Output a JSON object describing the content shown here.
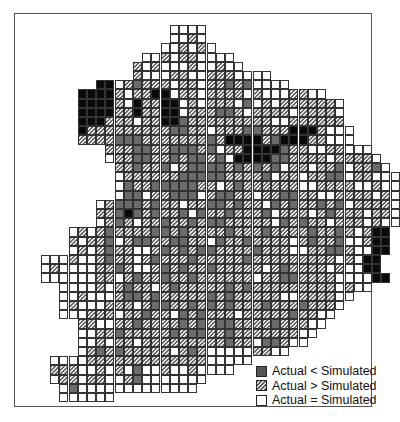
{
  "map": {
    "cell_size": 9.2,
    "origin": {
      "x": 22.5,
      "y": 25
    },
    "rows": [
      {
        "start": 16,
        "cells": "WWWW"
      },
      {
        "start": 16,
        "cells": "WWHW"
      },
      {
        "start": 15,
        "cells": "WWHWHW"
      },
      {
        "start": 13,
        "cells": "WWHWHHWWWW"
      },
      {
        "start": 12,
        "cells": "HWHWWWHWWHWW"
      },
      {
        "start": 12,
        "cells": "HWWWHHWWHHHWWWW"
      },
      {
        "start": 8,
        "cells": "BBWHDHHHWHHWHHDHDWWWW"
      },
      {
        "start": 6,
        "cells": "BBBBHWHHBBWHHWHHHHWHWWWHHWW"
      },
      {
        "start": 6,
        "cells": "BBBBHWBHHBBWHWHHHWDWHWHHHHHHW"
      },
      {
        "start": 6,
        "cells": "BBBBHHBHHBBWHHHDDHWHHHHWHHHHW"
      },
      {
        "start": 6,
        "cells": "BBBHHHWHHBBDHHHHHHHHHWWHHHHHH"
      },
      {
        "start": 6,
        "cells": "BHHHHHHHHHDDHHWHHHDDHHHBBBHWWW"
      },
      {
        "start": 6,
        "cells": "HHHHDDDHHHHHHHDHBBBBHDBBBHHWWW"
      },
      {
        "start": 9,
        "cells": "HHHDDHHDDDHDWHHBBBBDHHWWHHWWW"
      },
      {
        "start": 9,
        "cells": "WHHDDHHDHDDHDWBBBBDDHHHHWHHHHW"
      },
      {
        "start": 10,
        "cells": "HHDHHDWHDDDDHDHDHDWHHWHHDWHHDW"
      },
      {
        "start": 10,
        "cells": "WHHHHHHDDDDDHHHHDWHHWHHDDWHHWWW"
      },
      {
        "start": 10,
        "cells": "WDHHDDDDDHHWHDHHHHHHWWHHHHWWHWW"
      },
      {
        "start": 10,
        "cells": "WDDWHHDDDWHDDHHWHHDDHHWWHHHHWHW"
      },
      {
        "start": 8,
        "cells": "WHDDDHDHHWHHDDHDHHWDHDHHDHDWHHHHW"
      },
      {
        "start": 8,
        "cells": "HHDBDHDHHDWDHHDHHHDWHHHWHDHHHWHHW"
      },
      {
        "start": 8,
        "cells": "WHDHWHHDHHDHDDHHHHHWDHDHHWHHHWHWW"
      },
      {
        "start": 5,
        "cells": "WHWHDHHHHDDHDHHHHDHHHDHHHHDHHDHWHBB"
      },
      {
        "start": 5,
        "cells": "HWHHDWHDDHHDDHHWDHHDHHHHWHDHHDWWHBB"
      },
      {
        "start": 5,
        "cells": "WHWHDHHWWHDHDHDDHHHHDHHHWWHHDDHWWBB"
      },
      {
        "start": 2,
        "cells": "WWWHWWHDHHWHDHHHDHHHHHDHHHHHHHHHWHWBB"
      },
      {
        "start": 2,
        "cells": "WHWWWWHHDHWWHDHDHHDHHHHHWHDHHHHWHWWBB"
      },
      {
        "start": 2,
        "cells": "WWWWWWHHWHDHHDHHDHHHHHHWHHDDHHHHWWWWBB"
      },
      {
        "start": 4,
        "cells": "WWWWHWHDHHWHDHHHHHDHDHHHHHHHHHWHWW"
      },
      {
        "start": 4,
        "cells": "WWHWWWHDDHDHHHHHDHDHHHHHWWHHHHWW"
      },
      {
        "start": 4,
        "cells": "WHWWWHHHWHDDHHDHDHDHHHDHHHDHHHW"
      },
      {
        "start": 4,
        "cells": "WWWHHHWHHDHHWDHDHHHWHHHHHDHHWW"
      },
      {
        "start": 6,
        "cells": "HHWWHHDHHHHDHDHDDHHHHDHHHWW"
      },
      {
        "start": 6,
        "cells": "WWHHDHHHHHDHDDHHDHHHHHHHWW"
      },
      {
        "start": 6,
        "cells": "WWHWHHWHHHHHHHHHDHHWDDHWW"
      },
      {
        "start": 6,
        "cells": "WHDHDHHHHHWHDHWWWWWHHWW"
      },
      {
        "start": 3,
        "cells": "WWWWHHHHHHHHHHHHHWWWWW"
      },
      {
        "start": 3,
        "cells": "HHHWWHWHWDWWHWWHWWWW"
      },
      {
        "start": 3,
        "cells": "WHHWHHWWHDWWWWWWW"
      },
      {
        "start": 4,
        "cells": "WDWWWWWWWWWWWWW"
      },
      {
        "start": 4,
        "cells": "WWWWWW"
      }
    ]
  },
  "legend": {
    "items": [
      {
        "code": "D",
        "label": "Actual < Simulated"
      },
      {
        "code": "H",
        "label": "Actual > Simulated"
      },
      {
        "code": "W",
        "label": "Actual = Simulated"
      }
    ]
  },
  "colors": {
    "dark": "#6b6b6b",
    "black": "#0a0a0a",
    "hatch_line": "#666666",
    "hatch_bg": "#e6e6e6",
    "grid_line": "#333333",
    "frame": "#555555"
  }
}
